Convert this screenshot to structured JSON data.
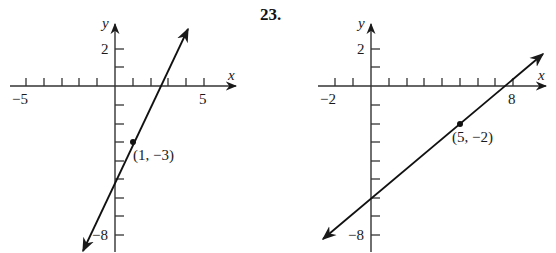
{
  "problem_number": "23.",
  "graphs": [
    {
      "id": "left",
      "x_axis_label": "x",
      "y_axis_label": "y",
      "x_ticks_labeled": [
        "−5",
        "5"
      ],
      "y_ticks_labeled": [
        "2",
        "−8"
      ],
      "x_range": [
        -5,
        6
      ],
      "y_range": [
        -9,
        3
      ],
      "point": {
        "x": 1,
        "y": -3,
        "label": "(1, −3)"
      },
      "line": {
        "slope": 2,
        "y_intercept": -5
      }
    },
    {
      "id": "right",
      "x_axis_label": "x",
      "y_axis_label": "y",
      "x_ticks_labeled": [
        "−2",
        "8"
      ],
      "y_ticks_labeled": [
        "2",
        "−8"
      ],
      "x_range": [
        -2,
        9
      ],
      "y_range": [
        -9,
        3
      ],
      "point": {
        "x": 5,
        "y": -2,
        "label": "(5, −2)"
      },
      "line": {
        "slope": 0.6667,
        "y_intercept": -5.33
      }
    }
  ]
}
